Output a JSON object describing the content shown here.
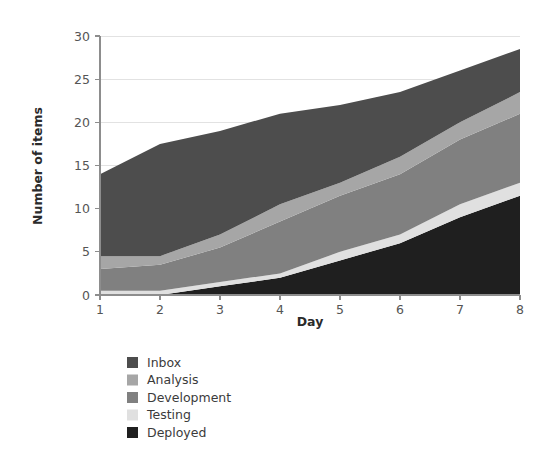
{
  "chart_data": {
    "type": "area",
    "title": "",
    "subtitle": "",
    "xlabel": "Day",
    "ylabel": "Number of items",
    "x": [
      1,
      2,
      3,
      4,
      5,
      6,
      7,
      8
    ],
    "xlim": [
      1,
      8
    ],
    "ylim": [
      0,
      30
    ],
    "xticks": [
      "1",
      "2",
      "3",
      "4",
      "5",
      "6",
      "7",
      "8"
    ],
    "yticks": [
      "0",
      "5",
      "10",
      "15",
      "20",
      "25",
      "30"
    ],
    "grid": "horizontal",
    "stacked": true,
    "stack_order": "bottom-to-top: Deployed, Testing, Development, Analysis, Inbox",
    "legend_position": "below-left",
    "series": [
      {
        "name": "Inbox",
        "color": "#4d4d4d",
        "values": [
          9.5,
          13.0,
          12.0,
          10.5,
          9.0,
          7.5,
          6.0,
          5.0
        ]
      },
      {
        "name": "Analysis",
        "color": "#a6a6a6",
        "values": [
          1.5,
          1.0,
          1.5,
          2.0,
          1.5,
          2.0,
          2.0,
          2.5
        ]
      },
      {
        "name": "Development",
        "color": "#808080",
        "values": [
          2.5,
          3.0,
          4.0,
          6.0,
          6.5,
          7.0,
          7.5,
          8.0
        ]
      },
      {
        "name": "Testing",
        "color": "#e0e0e0",
        "values": [
          0.5,
          0.5,
          0.5,
          0.5,
          1.0,
          1.0,
          1.5,
          1.5
        ]
      },
      {
        "name": "Deployed",
        "color": "#1f1f1f",
        "values": [
          0.0,
          0.0,
          1.0,
          2.0,
          4.0,
          6.0,
          9.0,
          11.5
        ]
      }
    ],
    "cumulative_totals": [
      14.0,
      17.5,
      19.0,
      21.0,
      22.0,
      23.5,
      26.0,
      28.5
    ],
    "totals_note": "Top of stack per day"
  },
  "legend": {
    "items": [
      {
        "label": "Inbox",
        "color": "#4d4d4d"
      },
      {
        "label": "Analysis",
        "color": "#a6a6a6"
      },
      {
        "label": "Development",
        "color": "#808080"
      },
      {
        "label": "Testing",
        "color": "#e0e0e0"
      },
      {
        "label": "Deployed",
        "color": "#1f1f1f"
      }
    ]
  },
  "axes": {
    "x_title": "Day",
    "y_title": "Number of items"
  }
}
